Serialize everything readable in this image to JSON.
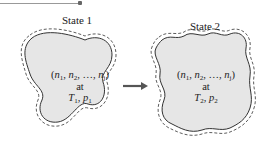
{
  "diagram": {
    "state1": {
      "title": "State 1",
      "composition": {
        "open": "(",
        "n1": "n",
        "s1": "1",
        "n2": "n",
        "s2": "2",
        "dots": ", …, ",
        "nj": "n",
        "sj": "j",
        "close": ")"
      },
      "at": "at",
      "T": "T",
      "Tsub": "1",
      "p": "p",
      "psub": "1"
    },
    "state2": {
      "title": "State 2",
      "composition": {
        "open": "(",
        "n1": "n",
        "s1": "1",
        "n2": "n",
        "s2": "2",
        "dots": ", …, ",
        "nj": "n",
        "sj": "j",
        "close": ")"
      },
      "at": "at",
      "T": "T",
      "Tsub": "2",
      "p": "p",
      "psub": "2"
    },
    "colors": {
      "fill": "#e6e6e6",
      "outline": "#333333",
      "arrow": "#555555"
    }
  }
}
